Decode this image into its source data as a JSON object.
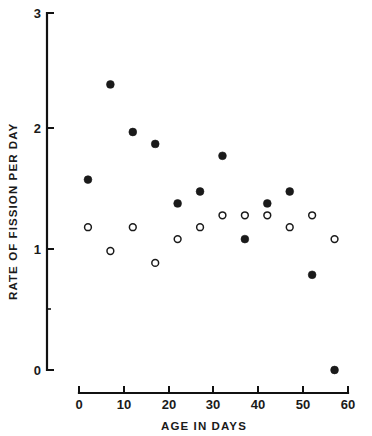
{
  "chart_data": {
    "type": "scatter",
    "title": "",
    "xlabel": "AGE IN DAYS",
    "ylabel": "RATE OF FISSION PER DAY",
    "xlim": [
      0,
      60
    ],
    "ylim": [
      0,
      3
    ],
    "x_ticks": [
      0,
      10,
      20,
      30,
      40,
      50,
      60
    ],
    "x_tick_labels": [
      "0",
      "10",
      "20",
      "30",
      "40",
      "50",
      "60"
    ],
    "y_ticks": [
      0,
      1,
      2,
      3
    ],
    "y_tick_labels": [
      "0",
      "1",
      "2",
      "3"
    ],
    "y_minor_ticks": [
      0.5
    ],
    "grid": false,
    "legend": "none",
    "series": [
      {
        "name": "closed-circles",
        "marker": "filled-circle",
        "color": "#1a1a1a",
        "x": [
          2,
          7,
          12,
          17,
          22,
          27,
          32,
          37,
          42,
          47,
          52,
          57
        ],
        "y": [
          1.6,
          2.4,
          2.0,
          1.9,
          1.4,
          1.5,
          1.8,
          1.1,
          1.4,
          1.5,
          0.8,
          0.0
        ]
      },
      {
        "name": "open-circles",
        "marker": "open-circle",
        "color": "#1a1a1a",
        "x": [
          2,
          7,
          12,
          17,
          22,
          27,
          32,
          37,
          42,
          47,
          52,
          57
        ],
        "y": [
          1.2,
          1.0,
          1.2,
          0.9,
          1.1,
          1.2,
          1.3,
          1.3,
          1.3,
          1.2,
          1.3,
          1.1
        ]
      }
    ]
  },
  "labels": {
    "y_axis_title": "RATE OF FISSION PER DAY",
    "x_axis_title": "AGE IN DAYS",
    "y0": "0",
    "y1": "1",
    "y2": "2",
    "y3": "3",
    "x0": "0",
    "x10": "10",
    "x20": "20",
    "x30": "30",
    "x40": "40",
    "x50": "50",
    "x60": "60"
  }
}
